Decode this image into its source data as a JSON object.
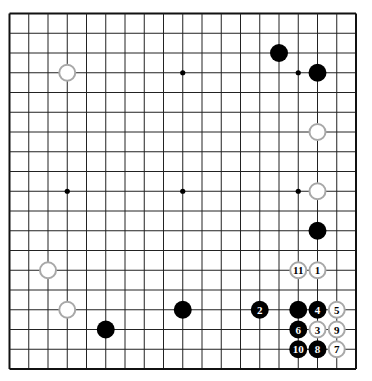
{
  "board": {
    "size": 19,
    "origin": {
      "x": 9.5,
      "y": 13.5
    },
    "spacing": {
      "x": 19.25,
      "y": 19.75
    },
    "line_color": "#222222",
    "edge_color": "#111111",
    "star_points": [
      [
        4,
        4
      ],
      [
        10,
        4
      ],
      [
        16,
        4
      ],
      [
        4,
        10
      ],
      [
        10,
        10
      ],
      [
        16,
        10
      ],
      [
        4,
        16
      ],
      [
        10,
        16
      ],
      [
        16,
        16
      ]
    ]
  },
  "colors": {
    "black_stone": "#000000",
    "white_stone_fill": "#ffffff",
    "white_stone_border": "#a8a8a8",
    "black_label": "#ffffff",
    "white_label": "#000000"
  },
  "stones": [
    {
      "color": "black",
      "col": 15,
      "row": 3,
      "label": ""
    },
    {
      "color": "black",
      "col": 17,
      "row": 4,
      "label": ""
    },
    {
      "color": "white",
      "col": 4,
      "row": 4,
      "label": ""
    },
    {
      "color": "white",
      "col": 17,
      "row": 7,
      "label": ""
    },
    {
      "color": "white",
      "col": 17,
      "row": 10,
      "label": ""
    },
    {
      "color": "black",
      "col": 17,
      "row": 12,
      "label": ""
    },
    {
      "color": "white",
      "col": 3,
      "row": 14,
      "label": ""
    },
    {
      "color": "white",
      "col": 4,
      "row": 16,
      "label": ""
    },
    {
      "color": "black",
      "col": 6,
      "row": 17,
      "label": ""
    },
    {
      "color": "black",
      "col": 10,
      "row": 16,
      "label": ""
    },
    {
      "color": "black",
      "col": 16,
      "row": 16,
      "label": ""
    },
    {
      "color": "white",
      "col": 17,
      "row": 14,
      "label": "1"
    },
    {
      "color": "black",
      "col": 14,
      "row": 16,
      "label": "2"
    },
    {
      "color": "white",
      "col": 17,
      "row": 17,
      "label": "3"
    },
    {
      "color": "black",
      "col": 17,
      "row": 16,
      "label": "4"
    },
    {
      "color": "white",
      "col": 18,
      "row": 16,
      "label": "5"
    },
    {
      "color": "black",
      "col": 16,
      "row": 17,
      "label": "6"
    },
    {
      "color": "white",
      "col": 18,
      "row": 18,
      "label": "7"
    },
    {
      "color": "black",
      "col": 17,
      "row": 18,
      "label": "8"
    },
    {
      "color": "white",
      "col": 18,
      "row": 17,
      "label": "9"
    },
    {
      "color": "black",
      "col": 16,
      "row": 18,
      "label": "10"
    },
    {
      "color": "white",
      "col": 16,
      "row": 14,
      "label": "11"
    }
  ]
}
